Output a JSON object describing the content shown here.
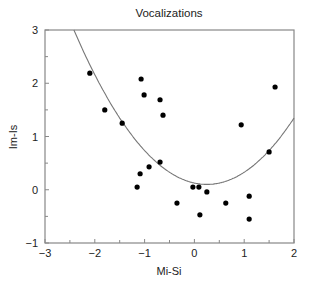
{
  "chart_data": {
    "type": "scatter",
    "title": "Vocalizations",
    "xlabel": "Mi-Si",
    "ylabel": "Im-Is",
    "xlim": [
      -3,
      2
    ],
    "ylim": [
      -1,
      3
    ],
    "xticks": [
      -3,
      -2,
      -1,
      0,
      1,
      2
    ],
    "yticks": [
      -1,
      0,
      1,
      2,
      3
    ],
    "xtick_labels": [
      "−3",
      "−2",
      "−1",
      "0",
      "1",
      "2"
    ],
    "ytick_labels": [
      "−1",
      "0",
      "1",
      "2",
      "3"
    ],
    "grid": false,
    "legend": null,
    "series": [
      {
        "name": "points",
        "points": [
          [
            -2.1,
            2.19
          ],
          [
            -1.8,
            1.5
          ],
          [
            -1.45,
            1.25
          ],
          [
            -1.07,
            2.08
          ],
          [
            -1.01,
            1.78
          ],
          [
            -0.69,
            1.69
          ],
          [
            -0.63,
            1.4
          ],
          [
            1.62,
            1.93
          ],
          [
            0.94,
            1.22
          ],
          [
            1.5,
            0.71
          ],
          [
            -0.69,
            0.52
          ],
          [
            -0.91,
            0.43
          ],
          [
            -1.09,
            0.3
          ],
          [
            -1.15,
            0.05
          ],
          [
            -0.03,
            0.05
          ],
          [
            0.09,
            0.05
          ],
          [
            0.25,
            -0.04
          ],
          [
            -0.35,
            -0.25
          ],
          [
            0.63,
            -0.25
          ],
          [
            1.1,
            -0.12
          ],
          [
            0.11,
            -0.47
          ],
          [
            1.1,
            -0.55
          ]
        ]
      },
      {
        "name": "fitted curve",
        "type": "line",
        "description": "parabola y = 0.10 + 0.407*(x - 0.25)^2",
        "vertex": [
          0.25,
          0.1
        ],
        "a": 0.407
      }
    ]
  }
}
